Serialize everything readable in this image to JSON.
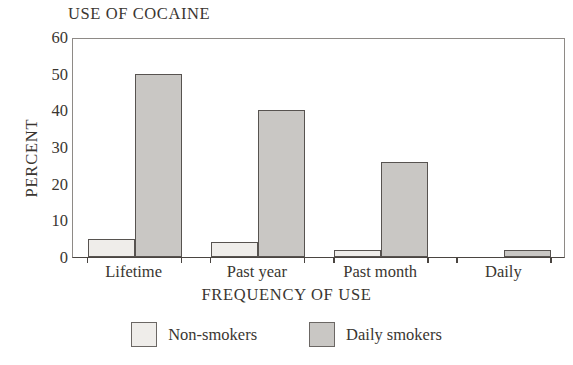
{
  "chart_data": {
    "type": "bar",
    "title": "USE OF COCAINE",
    "xlabel": "FREQUENCY OF USE",
    "ylabel": "PERCENT",
    "categories": [
      "Lifetime",
      "Past year",
      "Past month",
      "Daily"
    ],
    "series": [
      {
        "name": "Non-smokers",
        "values": [
          5,
          4,
          2,
          0
        ],
        "color": "#efedea"
      },
      {
        "name": "Daily smokers",
        "values": [
          50,
          40,
          26,
          2
        ],
        "color": "#c9c7c4"
      }
    ],
    "ylim": [
      0,
      60
    ],
    "yticks": [
      0,
      10,
      20,
      30,
      40,
      50,
      60
    ],
    "ytick_labels": [
      "0",
      "10",
      "20",
      "30",
      "40",
      "50",
      "60"
    ],
    "grid": false,
    "legend_position": "bottom-center",
    "bar_edge_color": "#575350",
    "frame_color": "#8e8a86"
  }
}
